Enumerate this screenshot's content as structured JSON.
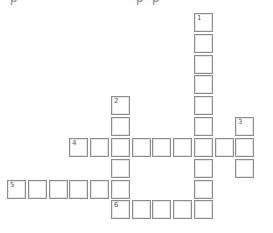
{
  "clipped_text": [
    "p",
    "p",
    "p"
  ],
  "pitch": 20.7,
  "clues": [
    {
      "num": "1",
      "dir": "down",
      "col": 9,
      "row": 0,
      "len": 10
    },
    {
      "num": "2",
      "dir": "down",
      "col": 5,
      "row": 4,
      "len": 6
    },
    {
      "num": "3",
      "dir": "down",
      "col": 11,
      "row": 5,
      "len": 3
    },
    {
      "num": "4",
      "dir": "across",
      "col": 3,
      "row": 6,
      "len": 9
    },
    {
      "num": "5",
      "dir": "across",
      "col": 0,
      "row": 8,
      "len": 6
    },
    {
      "num": "6",
      "dir": "across",
      "col": 5,
      "row": 9,
      "len": 5
    }
  ]
}
